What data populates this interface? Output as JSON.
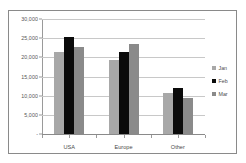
{
  "title_strip": {
    "faint_text": "·····  ····  ······"
  },
  "legend": {
    "position": "right",
    "items": [
      {
        "label": "Jan",
        "color": "#a8a8a8",
        "swatch": "jan"
      },
      {
        "label": "Feb",
        "color": "#0b0b0b",
        "swatch": "feb"
      },
      {
        "label": "Mar",
        "color": "#8a8a8a",
        "swatch": "mar"
      }
    ]
  },
  "axis": {
    "y_ticks": [
      "30,000",
      "25,000",
      "20,000",
      "15,000",
      "10,000",
      "5,000",
      "-"
    ],
    "x_ticks": [
      "USA",
      "Europe",
      "Other"
    ]
  },
  "chart_data": {
    "type": "bar",
    "title": "",
    "xlabel": "",
    "ylabel": "",
    "categories": [
      "USA",
      "Europe",
      "Other"
    ],
    "series": [
      {
        "name": "Jan",
        "color": "#a8a8a8",
        "values": [
          21500,
          19200,
          10600
        ]
      },
      {
        "name": "Feb",
        "color": "#0b0b0b",
        "values": [
          25300,
          21300,
          12100
        ]
      },
      {
        "name": "Mar",
        "color": "#8a8a8a",
        "values": [
          22700,
          23500,
          9500
        ]
      }
    ],
    "ylim": [
      0,
      30000
    ],
    "ytick_values": [
      0,
      5000,
      10000,
      15000,
      20000,
      25000,
      30000
    ],
    "ytick_labels": [
      "-",
      "5,000",
      "10,000",
      "15,000",
      "20,000",
      "25,000",
      "30,000"
    ],
    "grid": true,
    "grid_axis": "y",
    "legend_position": "right",
    "bar_grouping": "clustered"
  }
}
